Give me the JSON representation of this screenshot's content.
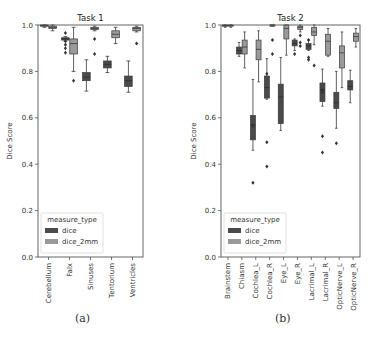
{
  "colors": {
    "dice": "#4a4a4a",
    "dice_2mm": "#9a9a9a",
    "axis": "#555555"
  },
  "captions": {
    "a": "(a)",
    "b": "(b)"
  },
  "chart_data": [
    {
      "type": "box",
      "title": "Task 1",
      "xlabel": "",
      "ylabel": "Dice Score",
      "ylim": [
        0.0,
        1.0
      ],
      "yticks": [
        "0.0",
        "0.2",
        "0.4",
        "0.6",
        "0.8",
        "1.0"
      ],
      "legend": {
        "title": "measure_type",
        "entries": [
          "dice",
          "dice_2mm"
        ],
        "position": "lower left"
      },
      "categories": [
        "Cerebellum",
        "Falx",
        "Sinuses",
        "Tentorium",
        "Ventricles"
      ],
      "series": [
        {
          "name": "dice",
          "boxes": [
            {
              "q1": 0.995,
              "median": 0.998,
              "q3": 1.0,
              "lo": 0.99,
              "hi": 1.0,
              "outliers": []
            },
            {
              "q1": 0.935,
              "median": 0.94,
              "q3": 0.945,
              "lo": 0.93,
              "hi": 0.95,
              "outliers": [
                0.965,
                0.93,
                0.915,
                0.9,
                0.88
              ]
            },
            {
              "q1": 0.76,
              "median": 0.775,
              "q3": 0.795,
              "lo": 0.715,
              "hi": 0.85,
              "outliers": []
            },
            {
              "q1": 0.815,
              "median": 0.83,
              "q3": 0.845,
              "lo": 0.795,
              "hi": 0.865,
              "outliers": []
            },
            {
              "q1": 0.735,
              "median": 0.76,
              "q3": 0.78,
              "lo": 0.71,
              "hi": 0.845,
              "outliers": []
            }
          ]
        },
        {
          "name": "dice_2mm",
          "boxes": [
            {
              "q1": 0.985,
              "median": 0.99,
              "q3": 0.995,
              "lo": 0.975,
              "hi": 1.0,
              "outliers": []
            },
            {
              "q1": 0.875,
              "median": 0.92,
              "q3": 0.94,
              "lo": 0.8,
              "hi": 0.99,
              "outliers": [
                0.76
              ]
            },
            {
              "q1": 0.98,
              "median": 0.985,
              "q3": 0.99,
              "lo": 0.975,
              "hi": 0.995,
              "outliers": [
                0.94,
                0.875
              ]
            },
            {
              "q1": 0.945,
              "median": 0.96,
              "q3": 0.975,
              "lo": 0.92,
              "hi": 0.99,
              "outliers": []
            },
            {
              "q1": 0.975,
              "median": 0.985,
              "q3": 0.99,
              "lo": 0.97,
              "hi": 0.995,
              "outliers": [
                0.92
              ]
            }
          ]
        }
      ]
    },
    {
      "type": "box",
      "title": "Task 2",
      "xlabel": "",
      "ylabel": "Dice Score",
      "ylim": [
        0.0,
        1.0
      ],
      "yticks": [
        "0.0",
        "0.2",
        "0.4",
        "0.6",
        "0.8",
        "1.0"
      ],
      "legend": {
        "title": "measure_type",
        "entries": [
          "dice",
          "dice_2mm"
        ],
        "position": "lower left"
      },
      "categories": [
        "Brainstem",
        "Chiasm",
        "Cochlea_L",
        "Cochlea_R",
        "Eye_L",
        "Eye_R",
        "Lacrimal_L",
        "Lacrimal_R",
        "OpticNerve_L",
        "OpticNerve_R"
      ],
      "series": [
        {
          "name": "dice",
          "boxes": [
            {
              "q1": 0.995,
              "median": 0.998,
              "q3": 1.0,
              "lo": 0.99,
              "hi": 1.0,
              "outliers": []
            },
            {
              "q1": 0.875,
              "median": 0.89,
              "q3": 0.905,
              "lo": 0.865,
              "hi": 0.925,
              "outliers": []
            },
            {
              "q1": 0.505,
              "median": 0.57,
              "q3": 0.61,
              "lo": 0.46,
              "hi": 0.765,
              "outliers": [
                0.565,
                0.32
              ]
            },
            {
              "q1": 0.685,
              "median": 0.73,
              "q3": 0.78,
              "lo": 0.68,
              "hi": 0.855,
              "outliers": [
                0.79,
                0.495,
                0.39
              ]
            },
            {
              "q1": 0.575,
              "median": 0.69,
              "q3": 0.745,
              "lo": 0.545,
              "hi": 0.86,
              "outliers": []
            },
            {
              "q1": 0.91,
              "median": 0.92,
              "q3": 0.935,
              "lo": 0.89,
              "hi": 0.94,
              "outliers": [
                0.875
              ]
            },
            {
              "q1": 0.895,
              "median": 0.91,
              "q3": 0.92,
              "lo": 0.89,
              "hi": 0.935,
              "outliers": [
                0.935,
                0.86,
                0.85
              ]
            },
            {
              "q1": 0.67,
              "median": 0.72,
              "q3": 0.75,
              "lo": 0.65,
              "hi": 0.81,
              "outliers": [
                0.72,
                0.71,
                0.52,
                0.45
              ]
            },
            {
              "q1": 0.64,
              "median": 0.665,
              "q3": 0.71,
              "lo": 0.555,
              "hi": 0.8,
              "outliers": [
                0.49
              ]
            },
            {
              "q1": 0.72,
              "median": 0.735,
              "q3": 0.76,
              "lo": 0.665,
              "hi": 0.805,
              "outliers": []
            }
          ]
        },
        {
          "name": "dice_2mm",
          "boxes": [
            {
              "q1": 0.995,
              "median": 0.998,
              "q3": 1.0,
              "lo": 0.99,
              "hi": 1.0,
              "outliers": []
            },
            {
              "q1": 0.875,
              "median": 0.905,
              "q3": 0.935,
              "lo": 0.815,
              "hi": 0.97,
              "outliers": []
            },
            {
              "q1": 0.85,
              "median": 0.895,
              "q3": 0.935,
              "lo": 0.755,
              "hi": 0.975,
              "outliers": []
            },
            {
              "q1": 0.998,
              "median": 1.0,
              "q3": 1.0,
              "lo": 0.995,
              "hi": 1.0,
              "outliers": [
                0.935,
                0.875
              ]
            },
            {
              "q1": 0.94,
              "median": 0.985,
              "q3": 1.0,
              "lo": 0.87,
              "hi": 1.0,
              "outliers": []
            },
            {
              "q1": 0.98,
              "median": 0.99,
              "q3": 0.995,
              "lo": 0.97,
              "hi": 1.0,
              "outliers": [
                0.955,
                0.925,
                0.91
              ]
            },
            {
              "q1": 0.955,
              "median": 0.97,
              "q3": 0.99,
              "lo": 0.915,
              "hi": 1.0,
              "outliers": [
                0.825
              ]
            },
            {
              "q1": 0.87,
              "median": 0.93,
              "q3": 0.96,
              "lo": 0.865,
              "hi": 0.985,
              "outliers": []
            },
            {
              "q1": 0.815,
              "median": 0.88,
              "q3": 0.91,
              "lo": 0.73,
              "hi": 0.97,
              "outliers": []
            },
            {
              "q1": 0.93,
              "median": 0.95,
              "q3": 0.965,
              "lo": 0.905,
              "hi": 0.985,
              "outliers": []
            }
          ]
        }
      ]
    }
  ]
}
